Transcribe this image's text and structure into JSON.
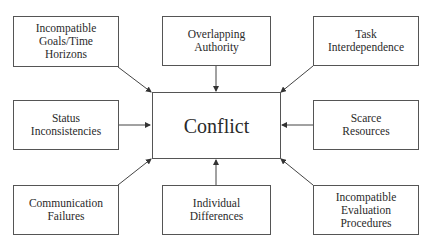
{
  "diagram": {
    "center": "Conflict",
    "causes": [
      {
        "id": "goals",
        "label": "Incompatible\nGoals/Time\nHorizons"
      },
      {
        "id": "authority",
        "label": "Overlapping\nAuthority"
      },
      {
        "id": "task",
        "label": "Task\nInterdependence"
      },
      {
        "id": "status",
        "label": "Status\nInconsistencies"
      },
      {
        "id": "resources",
        "label": "Scarce\nResources"
      },
      {
        "id": "communication",
        "label": "Communication\nFailures"
      },
      {
        "id": "individual",
        "label": "Individual\nDifferences"
      },
      {
        "id": "evaluation",
        "label": "Incompatible\nEvaluation\nProcedures"
      }
    ],
    "edges": [
      {
        "from": "goals",
        "to": "Conflict"
      },
      {
        "from": "authority",
        "to": "Conflict"
      },
      {
        "from": "task",
        "to": "Conflict"
      },
      {
        "from": "status",
        "to": "Conflict"
      },
      {
        "from": "resources",
        "to": "Conflict"
      },
      {
        "from": "communication",
        "to": "Conflict"
      },
      {
        "from": "individual",
        "to": "Conflict"
      },
      {
        "from": "evaluation",
        "to": "Conflict"
      }
    ]
  }
}
